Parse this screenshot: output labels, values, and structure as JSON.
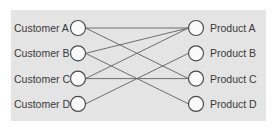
{
  "diagram": {
    "type": "bipartite-mapping",
    "left_nodes": [
      {
        "id": "CA",
        "label": "Customer A"
      },
      {
        "id": "CB",
        "label": "Customer B"
      },
      {
        "id": "CC",
        "label": "Customer C"
      },
      {
        "id": "CD",
        "label": "Customer D"
      }
    ],
    "right_nodes": [
      {
        "id": "PA",
        "label": "Product A"
      },
      {
        "id": "PB",
        "label": "Product B"
      },
      {
        "id": "PC",
        "label": "Product C"
      },
      {
        "id": "PD",
        "label": "Product D"
      }
    ],
    "edges": [
      {
        "from": "CA",
        "to": "PA"
      },
      {
        "from": "CA",
        "to": "PC"
      },
      {
        "from": "CB",
        "to": "PA"
      },
      {
        "from": "CB",
        "to": "PD"
      },
      {
        "from": "CC",
        "to": "PA"
      },
      {
        "from": "CC",
        "to": "PC"
      },
      {
        "from": "CD",
        "to": "PB"
      }
    ],
    "colors": {
      "panel": "#e4e4e4",
      "edge": "#6e6e6e",
      "node_stroke": "#4a4a4a",
      "node_fill": "#fafafa",
      "text": "#3a3a3a"
    }
  }
}
